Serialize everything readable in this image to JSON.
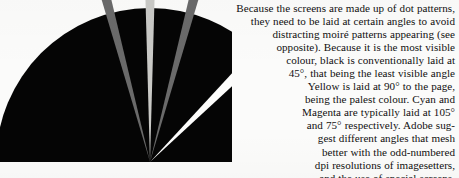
{
  "page": {
    "width": 459,
    "height": 178,
    "background_color": "#fbfbfa",
    "ink_color": "#111010"
  },
  "diagram": {
    "name": "screen-angle-fan-diagram",
    "center_x": 150,
    "center_y": 162,
    "radius": 154,
    "body_color": "#050505",
    "wedges": [
      {
        "label": "Cyan screen angle wedge",
        "angle_degrees": 105,
        "width_degrees": 3.2,
        "color": "#6a6a6a",
        "represents": "Cyan"
      },
      {
        "label": "Yellow screen angle wedge",
        "angle_degrees": 90,
        "width_degrees": 3.2,
        "color": "#c9c9c6",
        "represents": "Yellow"
      },
      {
        "label": "Magenta screen angle wedge",
        "angle_degrees": 75,
        "width_degrees": 3.2,
        "color": "#6a6a6a",
        "represents": "Magenta"
      },
      {
        "label": "Black screen angle wedge",
        "angle_degrees": 45,
        "width_degrees": 4.6,
        "color": "#fdfdfc",
        "represents": "Black"
      }
    ]
  },
  "body_text": {
    "alignment": "right",
    "lines": [
      "Because the screens are made up of dot patterns,",
      "they need to be laid at certain angles to avoid",
      "distracting moiré patterns appearing (see",
      "opposite). Because it is the most visible",
      "colour, black is conventionally laid at",
      "45°, that being the least visible angle",
      "Yellow is laid at 90° to the page,",
      "being the palest colour. Cyan and",
      "Magenta are typically laid at 105°",
      "and 75° respectively. Adobe sug-",
      "gest different angles that mesh",
      "better with the odd-numbered",
      "dpi resolutions of imagesetters,"
    ],
    "clipped_last_line": "and the use of special screens."
  }
}
